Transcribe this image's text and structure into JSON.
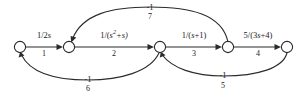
{
  "figure": {
    "type": "signal-flow-graph",
    "background_color": "#ffffff",
    "stroke_color": "#2b2b2b"
  },
  "nodes": [
    {
      "id": "n1",
      "label": "",
      "x": 20,
      "y": 47
    },
    {
      "id": "n2",
      "label": "",
      "x": 69,
      "y": 47
    },
    {
      "id": "n3",
      "label": "",
      "x": 160,
      "y": 47
    },
    {
      "id": "n4",
      "label": "",
      "x": 228,
      "y": 47
    },
    {
      "id": "n5",
      "label": "",
      "x": 287,
      "y": 47
    }
  ],
  "forward_branches": [
    {
      "index": "1",
      "gain_parts": {
        "numerator": "1/2",
        "variable": "s"
      },
      "gain_text": "1/2s",
      "from": "n1",
      "to": "n2",
      "label_x": 44,
      "label_y": 31,
      "index_x": 44,
      "index_y": 50
    },
    {
      "index": "2",
      "gain_parts": {
        "prefix": "1/(",
        "variable": "s",
        "exponent": "2",
        "suffix": "+s)"
      },
      "gain_text": "1/(s2+s)",
      "from": "n2",
      "to": "n3",
      "label_x": 114,
      "label_y": 31,
      "index_x": 114,
      "index_y": 50
    },
    {
      "index": "3",
      "gain_parts": {
        "prefix": "1/(",
        "variable": "s",
        "suffix": "+1)"
      },
      "gain_text": "1/(s+1)",
      "from": "n3",
      "to": "n4",
      "label_x": 194,
      "label_y": 31,
      "index_x": 194,
      "index_y": 50
    },
    {
      "index": "4",
      "gain_parts": {
        "prefix": "5/(3",
        "variable": "s",
        "suffix": "+4)"
      },
      "gain_text": "5/(3s+4)",
      "from": "n4",
      "to": "n5",
      "label_x": 258,
      "label_y": 31,
      "index_x": 258,
      "index_y": 50
    }
  ],
  "feedback_branches": [
    {
      "index": "7",
      "gain_text": "-1",
      "from": "n4",
      "to": "n2",
      "position": "top",
      "label_x": 150,
      "label_y": 4,
      "index_x": 150,
      "index_y": 14
    },
    {
      "index": "6",
      "gain_text": "-1",
      "from": "n3",
      "to": "n1",
      "position": "bottom-left",
      "label_x": 88,
      "label_y": 76,
      "index_x": 88,
      "index_y": 86
    },
    {
      "index": "5",
      "gain_text": "-1",
      "from": "n5",
      "to": "n3",
      "position": "bottom-right",
      "label_x": 223,
      "label_y": 72,
      "index_x": 223,
      "index_y": 83
    }
  ]
}
